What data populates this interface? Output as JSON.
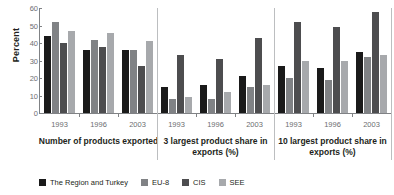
{
  "chart_data": {
    "type": "bar",
    "title": "",
    "xlabel": "",
    "ylabel": "Percent",
    "ylim": [
      0,
      60
    ],
    "yticks": [
      0,
      10,
      20,
      30,
      40,
      50,
      60
    ],
    "grid": false,
    "legend_position": "bottom",
    "categories": [
      "1993",
      "1996",
      "2003"
    ],
    "panels": [
      {
        "label": "Number of products exported",
        "categories": [
          "1993",
          "1996",
          "2003"
        ],
        "series": [
          {
            "name": "The Region and Turkey",
            "values": [
              44,
              36,
              36
            ]
          },
          {
            "name": "EU-8",
            "values": [
              52,
              42,
              36
            ]
          },
          {
            "name": "CIS",
            "values": [
              40,
              38,
              27
            ]
          },
          {
            "name": "SEE",
            "values": [
              47,
              46,
              41
            ]
          }
        ]
      },
      {
        "label": "3 largest product share in exports (%)",
        "categories": [
          "1993",
          "1996",
          "2003"
        ],
        "series": [
          {
            "name": "The Region and Turkey",
            "values": [
              15,
              16,
              21
            ]
          },
          {
            "name": "EU-8",
            "values": [
              8,
              8,
              15
            ]
          },
          {
            "name": "CIS",
            "values": [
              33,
              31,
              43
            ]
          },
          {
            "name": "SEE",
            "values": [
              9,
              12,
              16
            ]
          }
        ]
      },
      {
        "label": "10 largest product share in exports (%)",
        "categories": [
          "1993",
          "1996",
          "2003"
        ],
        "series": [
          {
            "name": "The Region and Turkey",
            "values": [
              27,
              26,
              35
            ]
          },
          {
            "name": "EU-8",
            "values": [
              20,
              19,
              32
            ]
          },
          {
            "name": "CIS",
            "values": [
              52,
              49,
              58
            ]
          },
          {
            "name": "SEE",
            "values": [
              30,
              30,
              33
            ]
          }
        ]
      }
    ],
    "series_colors": [
      "#1a1a1a",
      "#808285",
      "#4d4d4f",
      "#a7a9ac"
    ],
    "legend": [
      {
        "label": "The Region and Turkey",
        "color": "#1a1a1a"
      },
      {
        "label": "EU-8",
        "color": "#808285"
      },
      {
        "label": "CIS",
        "color": "#4d4d4f"
      },
      {
        "label": "SEE",
        "color": "#a7a9ac"
      }
    ]
  }
}
